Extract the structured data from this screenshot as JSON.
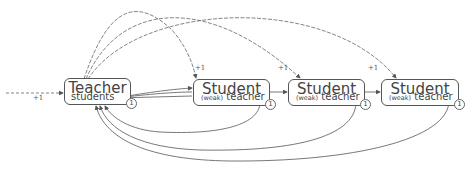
{
  "diagram": {
    "nodes": [
      {
        "id": "teacher",
        "title": "Teacher",
        "subtitle": "students",
        "badge": "1"
      },
      {
        "id": "student1",
        "title": "Student",
        "weak": "(weak)",
        "subtitle": "teacher",
        "badge": "1"
      },
      {
        "id": "student2",
        "title": "Student",
        "weak": "(weak)",
        "subtitle": "teacher",
        "badge": "1"
      },
      {
        "id": "student3",
        "title": "Student",
        "weak": "(weak)",
        "subtitle": "teacher",
        "badge": "1"
      }
    ],
    "edge_labels": {
      "incoming": "+1",
      "to_student1": "+1",
      "to_student2": "+1",
      "to_student3": "+1"
    },
    "colors": {
      "stroke": "#555555",
      "text": "#444444"
    }
  }
}
